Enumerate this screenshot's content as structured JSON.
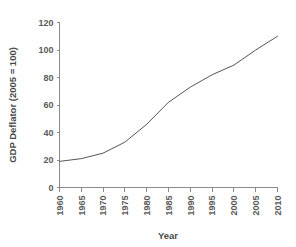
{
  "chart_data": {
    "type": "line",
    "title": "",
    "xlabel": "Year",
    "ylabel": "GDP Deflator (2005 = 100)",
    "x": [
      1960,
      1965,
      1970,
      1975,
      1980,
      1985,
      1990,
      1995,
      2000,
      2005,
      2010
    ],
    "values": [
      19,
      21,
      25,
      33,
      46,
      62,
      73,
      82,
      89,
      100,
      110
    ],
    "series": [
      {
        "name": "GDP Deflator",
        "values": [
          19,
          21,
          25,
          33,
          46,
          62,
          73,
          82,
          89,
          100,
          110
        ],
        "color": "#555555"
      }
    ],
    "xlim": [
      1960,
      2010
    ],
    "ylim": [
      0,
      120
    ],
    "xticks": [
      1960,
      1965,
      1970,
      1975,
      1980,
      1985,
      1990,
      1995,
      2000,
      2005,
      2010
    ],
    "xticklabels": [
      "1960",
      "1965",
      "1970",
      "1975",
      "1980",
      "1985",
      "1990",
      "1995",
      "2000",
      "2005",
      "2010"
    ],
    "yticks": [
      0,
      20,
      40,
      60,
      80,
      100,
      120
    ],
    "yticklabels": [
      "0",
      "20",
      "40",
      "60",
      "80",
      "100",
      "120"
    ],
    "grid": false,
    "legend": false,
    "legend_position": "none",
    "background_color": "#ffffff",
    "axis_color": "#8a8a8a",
    "text_color": "#5a5a5a"
  },
  "axes": {
    "x_title": "Year",
    "y_title": "GDP Deflator (2005 = 100)"
  }
}
